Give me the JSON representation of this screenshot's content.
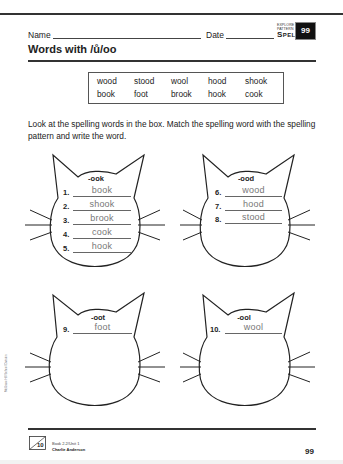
{
  "header": {
    "name_label": "Name",
    "date_label": "Date",
    "explore_label": "EXPLORE THE PATTERN",
    "section_label": "Spelling",
    "page_badge": "99"
  },
  "title": "Words with /ů/oo",
  "word_box": {
    "rows": [
      [
        "wood",
        "stood",
        "wool",
        "hood",
        "shook"
      ],
      [
        "book",
        "foot",
        "brook",
        "hook",
        "cook"
      ]
    ]
  },
  "instructions": "Look at the spelling words in the box. Match the spelling word with the spelling pattern and write the word.",
  "cats": [
    {
      "pattern": "-ook",
      "answers": [
        {
          "num": "1.",
          "word": "book"
        },
        {
          "num": "2.",
          "word": "shook"
        },
        {
          "num": "3.",
          "word": "brook"
        },
        {
          "num": "4.",
          "word": "cook"
        },
        {
          "num": "5.",
          "word": "hook"
        }
      ]
    },
    {
      "pattern": "-ood",
      "answers": [
        {
          "num": "6.",
          "word": "wood"
        },
        {
          "num": "7.",
          "word": "hood"
        },
        {
          "num": "8.",
          "word": "stood"
        }
      ]
    },
    {
      "pattern": "-oot",
      "answers": [
        {
          "num": "9.",
          "word": "foot"
        }
      ]
    },
    {
      "pattern": "-ool",
      "answers": [
        {
          "num": "10.",
          "word": "wool"
        }
      ]
    }
  ],
  "side_credit": "McGraw-Hill School Division",
  "footer": {
    "icon_number": "10",
    "book_unit": "Book 2.2/Unit 1",
    "author": "Charlie Anderson",
    "page_number": "99"
  }
}
